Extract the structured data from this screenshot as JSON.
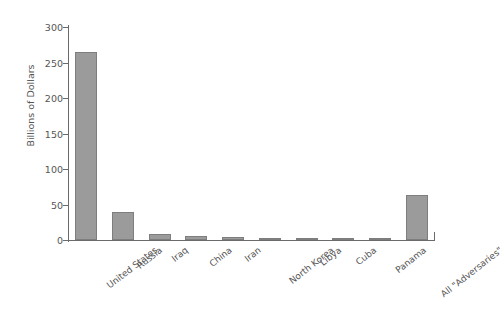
{
  "chart_data": {
    "type": "bar",
    "title": "",
    "subtitle": "",
    "xlabel": "",
    "ylabel": "Billions of Dollars",
    "ylim": [
      0,
      300
    ],
    "yticks": [
      0,
      50,
      100,
      150,
      200,
      250,
      300
    ],
    "grid": false,
    "legend": null,
    "bar_color": "#9b9b9b",
    "bar_edge_color": "#7e7e7e",
    "axis_color": "#6b6b6b",
    "background": "#ffffff",
    "categories": [
      "United States",
      "Russia",
      "Iraq",
      "China",
      "Iran",
      "North Korea",
      "Libya",
      "Cuba",
      "Panama",
      "All \"Adversaries\""
    ],
    "values": [
      265,
      40,
      8,
      6,
      4,
      3.5,
      3,
      2.5,
      1,
      63
    ],
    "units": "Billions of Dollars"
  }
}
